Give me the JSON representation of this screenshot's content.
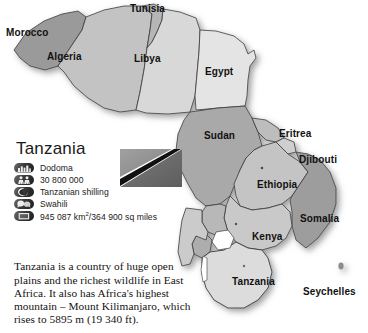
{
  "background_color": "#ffffff",
  "map": {
    "name": "north-and-east-africa-map",
    "palette": {
      "dark_grey": "#9a9a9a",
      "mid_grey": "#a9a9a9",
      "light_grey": "#d8d8d8",
      "pale_grey": "#e4e4e4",
      "water": "#ffffff",
      "border": "#3b3b3b",
      "label": "#111111"
    },
    "labels": [
      {
        "name": "map-label-morocco",
        "text": "Morocco",
        "x": 6,
        "y": 28
      },
      {
        "name": "map-label-tunisia",
        "text": "Tunisia",
        "x": 130,
        "y": 4
      },
      {
        "name": "map-label-algeria",
        "text": "Algeria",
        "x": 47,
        "y": 52
      },
      {
        "name": "map-label-libya",
        "text": "Libya",
        "x": 134,
        "y": 54
      },
      {
        "name": "map-label-egypt",
        "text": "Egypt",
        "x": 205,
        "y": 67
      },
      {
        "name": "map-label-sudan",
        "text": "Sudan",
        "x": 204,
        "y": 131
      },
      {
        "name": "map-label-eritrea",
        "text": "Eritrea",
        "x": 279,
        "y": 129
      },
      {
        "name": "map-label-djibouti",
        "text": "Djibouti",
        "x": 299,
        "y": 155
      },
      {
        "name": "map-label-ethiopia",
        "text": "Ethiopia",
        "x": 257,
        "y": 180
      },
      {
        "name": "map-label-somalia",
        "text": "Somalia",
        "x": 300,
        "y": 214
      },
      {
        "name": "map-label-kenya",
        "text": "Kenya",
        "x": 252,
        "y": 232
      },
      {
        "name": "map-label-tanzania",
        "text": "Tanzania",
        "x": 232,
        "y": 277
      },
      {
        "name": "map-label-seychelles",
        "text": "Seychelles",
        "x": 303,
        "y": 287
      }
    ]
  },
  "fact_panel": {
    "country_title": "Tanzania",
    "facts": [
      {
        "icon": "capital-city-icon",
        "label": "capital",
        "value": "Dodoma"
      },
      {
        "icon": "population-icon",
        "label": "population",
        "value": "30 800 000"
      },
      {
        "icon": "currency-icon",
        "label": "currency",
        "value": "Tanzanian shilling"
      },
      {
        "icon": "language-icon",
        "label": "language",
        "value": "Swahili"
      },
      {
        "icon": "area-icon",
        "label": "area",
        "value_prefix": "945 087 km",
        "value_sup": "2",
        "value_suffix": "/364 900 sq miles"
      }
    ]
  },
  "flag": {
    "name": "tanzania-flag",
    "description": "Tanzania flag in greyscale",
    "upper_triangle": "#8e8e8e",
    "lower_triangle": "#6d6d6d",
    "band": "#111111",
    "band_edge": "#ffffff"
  },
  "description": {
    "text": "Tanzania is a country of huge open plains and the richest wildlife in East Africa. It also has Africa's highest mountain – Mount Kilimanjaro, which rises to 5895 m (19 340 ft)."
  }
}
